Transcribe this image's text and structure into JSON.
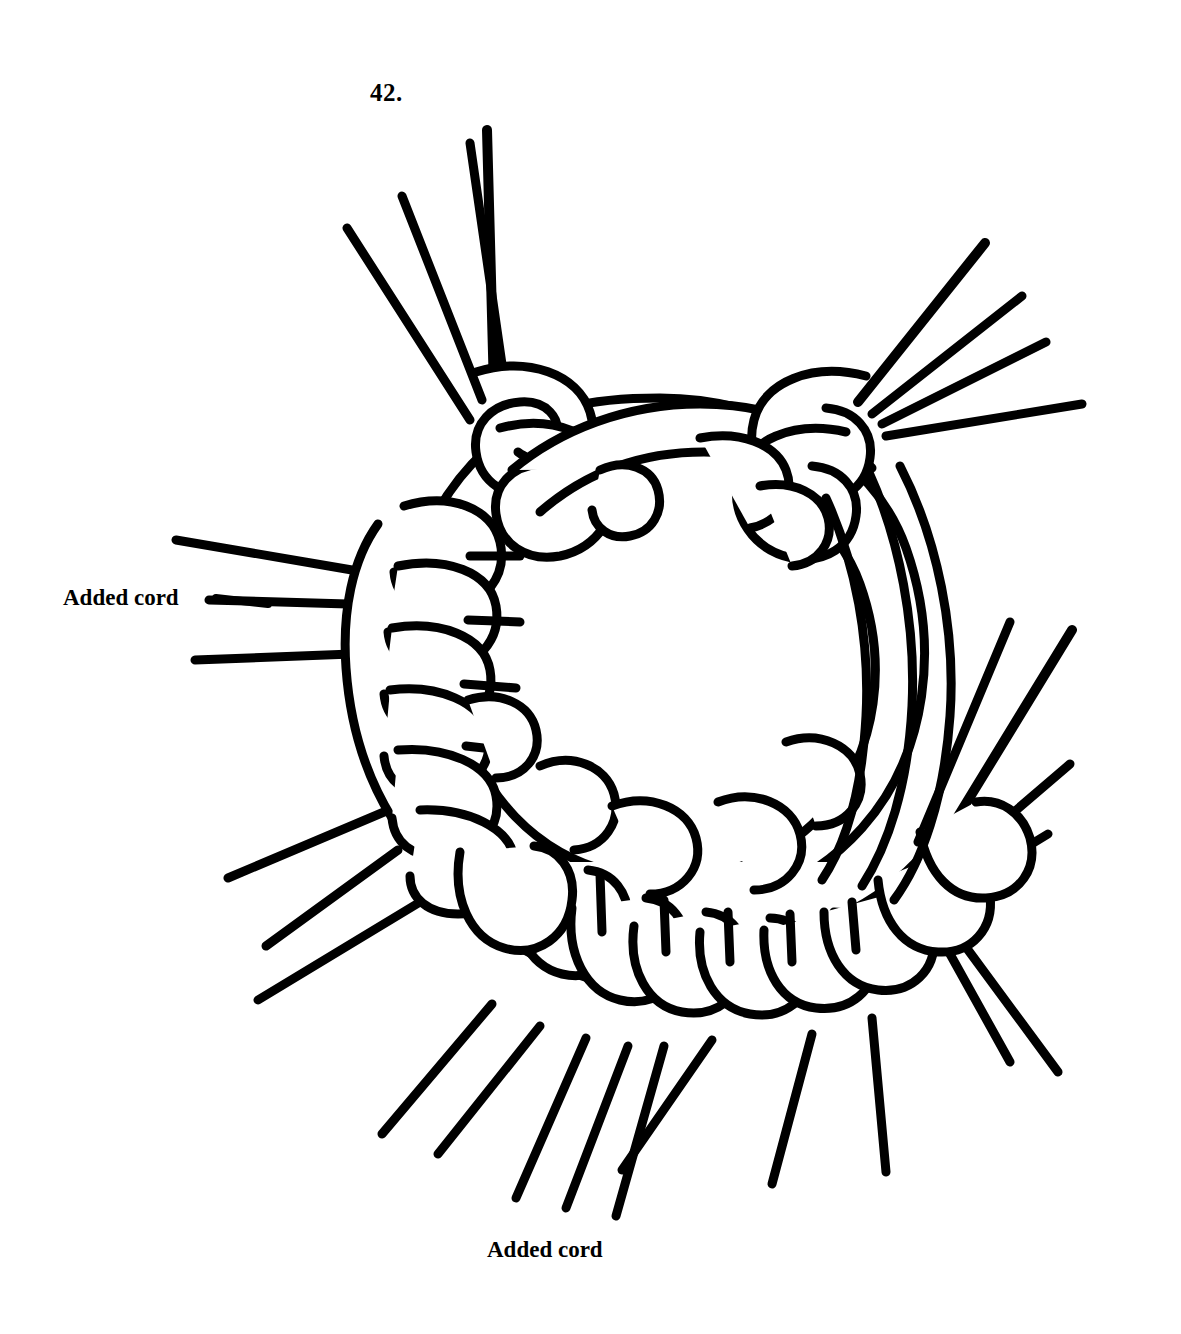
{
  "page": {
    "background_color": "#ffffff",
    "ink_color": "#000000",
    "width": 1181,
    "height": 1334
  },
  "figure": {
    "number_label": "42.",
    "kind": "line-drawing",
    "stroke_color": "#000000",
    "fill_color": "#ffffff",
    "stroke_width_px": 9
  },
  "annotations": [
    {
      "id": "left-added-cord",
      "text": "Added cord",
      "position": "left",
      "points_to": "vertical cord on left side of ring"
    },
    {
      "id": "bottom-added-cord",
      "text": "Added cord",
      "position": "bottom",
      "points_to": "horizontal cord across bottom of ring"
    }
  ],
  "labels": {
    "figure_number": "42.",
    "added_cord_left": "Added cord",
    "added_cord_bottom": "Added cord"
  },
  "structure": {
    "center_ring": {
      "cx": 660,
      "cy": 640,
      "rx": 215,
      "ry": 205,
      "description": "open circular cord core"
    },
    "cord_bundles": [
      {
        "name": "top-left-ends",
        "count": 4,
        "direction": "up-left"
      },
      {
        "name": "top-right-ends",
        "count": 4,
        "direction": "up-right"
      },
      {
        "name": "left-ends",
        "count": 3,
        "direction": "left"
      },
      {
        "name": "lower-left-ends",
        "count": 3,
        "direction": "down-left"
      },
      {
        "name": "bottom-ends",
        "count": 7,
        "direction": "down"
      },
      {
        "name": "right-ends",
        "count": 4,
        "direction": "right"
      }
    ],
    "hitch_count_left_column": 6,
    "hitch_count_bottom_row": 9
  }
}
